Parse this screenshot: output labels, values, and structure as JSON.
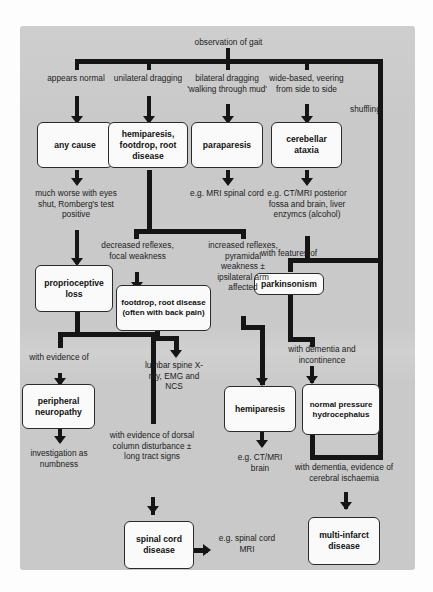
{
  "diagram": {
    "title": "observation of gait",
    "root_label": "observation of gait",
    "boxes": [
      {
        "id": "any_cause",
        "text": "any cause"
      },
      {
        "id": "hemi_foot_root",
        "text": "hemiparesis, footdrop, root disease"
      },
      {
        "id": "paraparesis",
        "text": "paraparesis"
      },
      {
        "id": "cerebellar",
        "text": "cerebellar ataxia"
      },
      {
        "id": "proprioceptive",
        "text": "proprioceptive loss"
      },
      {
        "id": "footdrop_root",
        "text": "footdrop, root disease (often with back pain)"
      },
      {
        "id": "parkinsonism",
        "text": "parkinsonism"
      },
      {
        "id": "peripheral_neuro",
        "text": "peripheral neuropathy"
      },
      {
        "id": "hemiparesis",
        "text": "hemiparesis"
      },
      {
        "id": "nph",
        "text": "normal pressure hydrocephalus"
      },
      {
        "id": "spinal_cord",
        "text": "spinal cord disease"
      },
      {
        "id": "multi_infarct",
        "text": "multi-infarct disease"
      }
    ],
    "branch_labels": {
      "appears_normal": "appears normal",
      "unilateral_dragging": "unilateral dragging",
      "bilateral_dragging": "bilateral dragging 'walking through mud'",
      "wide_based": "wide-based, veering from side to side",
      "shuffling": "shuffling"
    },
    "notes": {
      "much_worse": "much worse with eyes shut, Romberg's test positive",
      "eg_mri_spinal": "e.g. MRI spinal cord",
      "eg_ctmri_post": "e.g. CT/MRI posterior fossa and brain, liver enzymcs (alcohol)",
      "decreased_reflexes": "decreased reflexes, focal weakness",
      "increased_reflexes": "increased reflexes, pyramidal weakness ± ipsilateral arm affected",
      "with_features_of": "with features of",
      "lumbar_spine": "lumbar spine X-ray, EMG and NCS",
      "with_dementia_incont": "with dementia and incontinence",
      "with_evidence_of": "with evidence of",
      "with_evidence_dorsal": "with evidence of dorsal column disturbance ± long tract signs",
      "investigation_numbness": "investigation as numbness",
      "eg_ctmri_brain": "e.g. CT/MRI brain",
      "with_dementia_cerebral": "with dementia, evidence of cerebral ischaemia",
      "eg_spinal_cord_mri": "e.g. spinal cord MRI"
    },
    "colors": {
      "panel_background": "#c9c9c9",
      "box_fill": "#fafafa",
      "line": "#151515",
      "text": "#1c1c1c"
    }
  }
}
